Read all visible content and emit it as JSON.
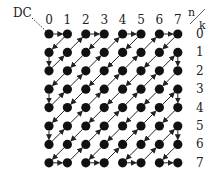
{
  "diagram": {
    "dc_label": "DC",
    "col_axis_label": "n",
    "row_axis_label": "k",
    "col_labels": [
      "0",
      "1",
      "2",
      "3",
      "4",
      "5",
      "6",
      "7"
    ],
    "row_labels": [
      "0",
      "1",
      "2",
      "3",
      "4",
      "5",
      "6",
      "7"
    ],
    "grid_size": 8,
    "scan": "zigzag",
    "colors": {
      "dot": "#111111",
      "line": "#222222",
      "background": "#ffffff"
    }
  }
}
